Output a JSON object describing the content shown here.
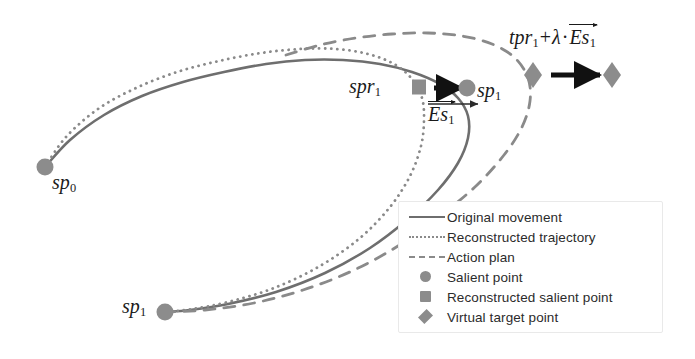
{
  "figure": {
    "width": 695,
    "height": 359,
    "background": "#ffffff"
  },
  "colors": {
    "original_movement": "#6e6e6e",
    "reconstructed_trajectory": "#8a8a8a",
    "action_plan": "#8a8a8a",
    "marker": "#8c8c8c",
    "arrow": "#111111",
    "text": "#1a1a1a",
    "legend_border": "#e9e9e9"
  },
  "labels": {
    "sp0": {
      "base": "sp",
      "sub": "0"
    },
    "sp1_lower": {
      "base": "sp",
      "sub": "1"
    },
    "sp1_upper": {
      "base": "sp",
      "sub": "1"
    },
    "spr1": {
      "base": "spr",
      "sub": "1"
    },
    "es1": {
      "base": "Es",
      "sub": "1"
    },
    "tpr_formula": {
      "term1_base": "tpr",
      "term1_sub": "1",
      "plus": "+",
      "lambda": "λ",
      "dot": "·",
      "vec_base": "Es",
      "vec_sub": "1"
    }
  },
  "legend": {
    "items": [
      {
        "key": "line-solid",
        "label": "Original movement"
      },
      {
        "key": "line-dotted",
        "label": "Reconstructed trajectory"
      },
      {
        "key": "line-dashed",
        "label": "Action plan"
      },
      {
        "key": "marker-circle",
        "label": "Salient point"
      },
      {
        "key": "marker-square",
        "label": "Reconstructed salient point"
      },
      {
        "key": "marker-diamond",
        "label": "Virtual target point"
      }
    ]
  },
  "chart_data": {
    "type": "line",
    "xlabel": "",
    "ylabel": "",
    "grid": false,
    "legend_position": "bottom-right",
    "xlim": [
      0,
      695
    ],
    "ylim": [
      359,
      0
    ],
    "series": [
      {
        "name": "Original movement",
        "style": "solid",
        "color": "#6e6e6e",
        "points": [
          [
            45,
            167
          ],
          [
            70,
            140
          ],
          [
            104,
            115
          ],
          [
            142,
            96
          ],
          [
            183,
            82
          ],
          [
            224,
            72
          ],
          [
            266,
            64
          ],
          [
            305,
            60
          ],
          [
            343,
            60
          ],
          [
            380,
            64
          ],
          [
            412,
            72
          ],
          [
            440,
            84
          ],
          [
            458,
            98
          ],
          [
            468,
            116
          ],
          [
            468,
            138
          ],
          [
            458,
            163
          ],
          [
            438,
            190
          ],
          [
            408,
            219
          ],
          [
            370,
            248
          ],
          [
            325,
            273
          ],
          [
            276,
            292
          ],
          [
            228,
            304
          ],
          [
            190,
            310
          ],
          [
            165,
            312
          ]
        ]
      },
      {
        "name": "Reconstructed trajectory",
        "style": "dotted",
        "color": "#8a8a8a",
        "points": [
          [
            45,
            167
          ],
          [
            66,
            137
          ],
          [
            98,
            109
          ],
          [
            136,
            88
          ],
          [
            177,
            72
          ],
          [
            219,
            61
          ],
          [
            261,
            53
          ],
          [
            300,
            49
          ],
          [
            336,
            49
          ],
          [
            368,
            54
          ],
          [
            394,
            64
          ],
          [
            412,
            79
          ],
          [
            422,
            98
          ],
          [
            424,
            120
          ],
          [
            421,
            146
          ],
          [
            410,
            176
          ],
          [
            390,
            207
          ],
          [
            360,
            238
          ],
          [
            320,
            266
          ],
          [
            274,
            288
          ],
          [
            228,
            302
          ],
          [
            192,
            309
          ],
          [
            165,
            312
          ]
        ]
      },
      {
        "name": "Action plan",
        "style": "dashed",
        "color": "#8a8a8a",
        "points": [
          [
            286,
            55
          ],
          [
            320,
            45
          ],
          [
            356,
            38
          ],
          [
            392,
            34
          ],
          [
            428,
            33
          ],
          [
            462,
            36
          ],
          [
            492,
            44
          ],
          [
            515,
            58
          ],
          [
            528,
            78
          ],
          [
            530,
            101
          ],
          [
            522,
            127
          ],
          [
            504,
            155
          ],
          [
            476,
            186
          ],
          [
            440,
            216
          ],
          [
            398,
            246
          ],
          [
            352,
            271
          ],
          [
            303,
            290
          ],
          [
            254,
            303
          ],
          [
            205,
            310
          ],
          [
            165,
            312
          ]
        ]
      }
    ],
    "markers": [
      {
        "name": "sp0",
        "type": "circle",
        "x": 45,
        "y": 167,
        "label": "sp0"
      },
      {
        "name": "sp1_lower",
        "type": "circle",
        "x": 165,
        "y": 312,
        "label": "sp1"
      },
      {
        "name": "sp1_upper",
        "type": "circle",
        "x": 467,
        "y": 88,
        "label": "sp1"
      },
      {
        "name": "spr1",
        "type": "square",
        "x": 419,
        "y": 87,
        "label": "spr1"
      },
      {
        "name": "tpr1",
        "type": "diamond",
        "x": 533,
        "y": 75,
        "label": "tpr1"
      },
      {
        "name": "virtual_target",
        "type": "diamond",
        "x": 612,
        "y": 75,
        "label": "tpr1 + lambda * Es1"
      }
    ],
    "arrows": [
      {
        "name": "es1-correction-arrow",
        "x1": 434,
        "y1": 88,
        "x2": 462,
        "y2": 88,
        "color": "#111111",
        "thick": true
      },
      {
        "name": "es1-measure-arrow",
        "x1": 428,
        "y1": 104,
        "x2": 478,
        "y2": 104,
        "color": "#2b2b2b",
        "thick": false
      },
      {
        "name": "virtual-target-arrow",
        "x1": 551,
        "y1": 75,
        "x2": 600,
        "y2": 75,
        "color": "#111111",
        "thick": true
      }
    ]
  }
}
